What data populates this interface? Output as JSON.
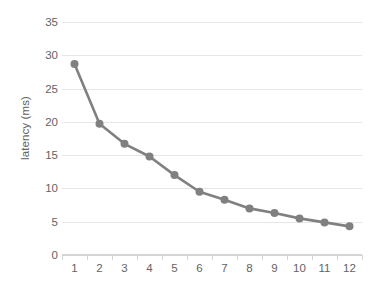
{
  "chart_data": {
    "type": "line",
    "title": "",
    "xlabel": "",
    "ylabel": "latency (ms)",
    "categories": [
      "1",
      "2",
      "3",
      "4",
      "5",
      "6",
      "7",
      "8",
      "9",
      "10",
      "11",
      "12"
    ],
    "values": [
      28.7,
      19.7,
      16.7,
      14.8,
      12.0,
      9.5,
      8.3,
      7.0,
      6.3,
      5.5,
      4.9,
      4.3
    ],
    "series": [
      {
        "name": "latency",
        "values": [
          28.7,
          19.7,
          16.7,
          14.8,
          12.0,
          9.5,
          8.3,
          7.0,
          6.3,
          5.5,
          4.9,
          4.3
        ]
      }
    ],
    "ylim": [
      0,
      35
    ],
    "yticks": [
      0,
      5,
      10,
      15,
      20,
      25,
      30,
      35
    ],
    "ytick_labels": [
      "0",
      "5",
      "10",
      "15",
      "20",
      "25",
      "30",
      "35"
    ],
    "grid": true,
    "grid_axis": "y",
    "legend": false,
    "legend_position": "none",
    "marker": "circle",
    "colors": {
      "line": "#808080",
      "marker": "#808080",
      "gridline": "#e6e6e6",
      "axis": "#d4d4d4",
      "text": "#636363",
      "background": "#ffffff"
    }
  }
}
